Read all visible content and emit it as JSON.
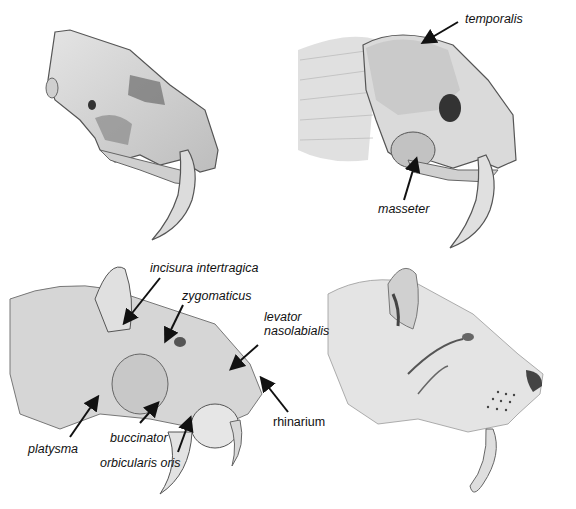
{
  "figure": {
    "panels": [
      {
        "id": "skull",
        "description": "Saber-toothed cat skull, lateral view",
        "labels": []
      },
      {
        "id": "skull-muscles",
        "description": "Skull with jaw muscles",
        "labels": [
          {
            "text": "temporalis",
            "x": 465,
            "y": 13,
            "arrow": [
              [
                458,
                22
              ],
              [
                424,
                42
              ]
            ]
          },
          {
            "text": "masseter",
            "x": 378,
            "y": 203,
            "arrow": [
              [
                404,
                200
              ],
              [
                416,
                160
              ]
            ]
          }
        ]
      },
      {
        "id": "face-muscles",
        "description": "Superficial facial musculature",
        "labels": [
          {
            "text": "incisura intertragica",
            "x": 150,
            "y": 262,
            "arrow": [
              [
                160,
                278
              ],
              [
                125,
                322
              ]
            ]
          },
          {
            "text": "zygomaticus",
            "x": 182,
            "y": 290,
            "arrow": [
              [
                183,
                305
              ],
              [
                166,
                340
              ]
            ]
          },
          {
            "text": "levator",
            "x": 264,
            "y": 311,
            "arrow": [
              [
                258,
                345
              ],
              [
                232,
                368
              ]
            ]
          },
          {
            "text": "nasolabialis",
            "x": 264,
            "y": 325,
            "arrow": []
          },
          {
            "text": "rhinarium",
            "x": 273,
            "y": 416,
            "arrow": [
              [
                288,
                412
              ],
              [
                262,
                379
              ]
            ]
          },
          {
            "text": "platysma",
            "x": 28,
            "y": 443,
            "arrow": [
              [
                70,
                437
              ],
              [
                97,
                398
              ]
            ]
          },
          {
            "text": "buccinator",
            "x": 110,
            "y": 432,
            "arrow": [
              [
                140,
                423
              ],
              [
                157,
                404
              ]
            ]
          },
          {
            "text": "orbicularis oris",
            "x": 100,
            "y": 457,
            "arrow": [
              [
                178,
                452
              ],
              [
                190,
                419
              ]
            ]
          }
        ]
      },
      {
        "id": "head",
        "description": "Fully fleshed head reconstruction",
        "labels": []
      }
    ]
  },
  "colors": {
    "background": "#ffffff",
    "ink": "#111111",
    "pencil_dark": "#4a4a4a",
    "pencil_mid": "#9a9a9a",
    "pencil_light": "#d6d6d6"
  }
}
